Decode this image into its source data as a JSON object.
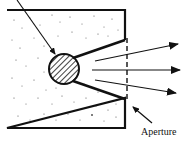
{
  "diagram": {
    "type": "blackbody cavity radiator schematic",
    "labels": {
      "aperture": "Aperture"
    },
    "colors": {
      "ink": "#111111",
      "background": "#ffffff",
      "speckle": "#555555"
    },
    "elements": {
      "enclosure": "speckled insulated box",
      "source": "hatched spherical cavity source",
      "incoming_ray": "diagonal arrow into cavity",
      "outgoing_rays": 3,
      "aperture": "dashed opening on right wall"
    }
  }
}
